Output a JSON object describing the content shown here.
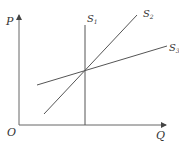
{
  "diagram": {
    "type": "supply-curves",
    "axes": {
      "y_label": "P",
      "x_label": "Q",
      "origin_label": "O"
    },
    "curves": [
      {
        "name": "S",
        "sub": "1",
        "description": "perfectly inelastic vertical supply"
      },
      {
        "name": "S",
        "sub": "2",
        "description": "steeper upward-sloping supply"
      },
      {
        "name": "S",
        "sub": "3",
        "description": "flatter upward-sloping supply"
      }
    ],
    "colors": {
      "line": "#555555",
      "text": "#333333"
    }
  }
}
